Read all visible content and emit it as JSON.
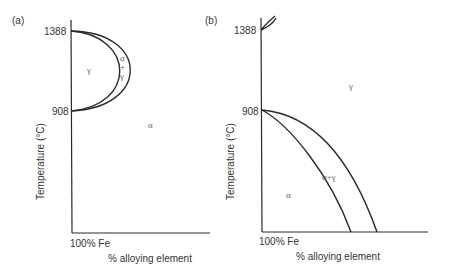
{
  "figure": {
    "panels": [
      {
        "id": "a",
        "label": "(a)",
        "y_axis_label": "Temperature (°C)",
        "x_axis_label": "% alloying element",
        "x_origin_label": "100% Fe",
        "y_ticks": [
          "1388",
          "908"
        ],
        "regions": {
          "gamma": "γ",
          "alpha_plus_gamma_1": "α",
          "alpha_plus_gamma_2": "+",
          "alpha_plus_gamma_3": "γ",
          "alpha": "α"
        },
        "description": "Closed gamma loop: gamma field bounded between 908 and 1388 °C, enclosed by a two-phase α+γ band"
      },
      {
        "id": "b",
        "label": "(b)",
        "y_axis_label": "Temperature (°C)",
        "x_axis_label": "% alloying element",
        "x_origin_label": "100% Fe",
        "y_ticks": [
          "1388",
          "908"
        ],
        "regions": {
          "gamma": "γ",
          "alpha_plus_gamma": "α+γ",
          "alpha": "α"
        },
        "description": "Open gamma field: A3 temperature depressed from 908 °C with increasing alloy content"
      }
    ]
  }
}
